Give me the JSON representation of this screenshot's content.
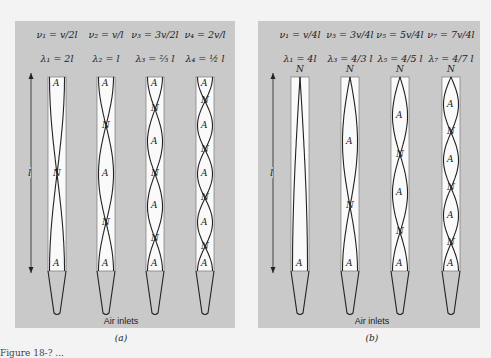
{
  "figure": {
    "panels": [
      {
        "id": "a",
        "sublabel": "(a)",
        "inlet_label": "Air inlets",
        "length_label": "l",
        "end_type": "open-open",
        "modes": [
          {
            "freq": "ν₁ = v/2l",
            "wavelength": "λ₁ = 2l",
            "harmonic": 1,
            "top": "A",
            "bottom": "A",
            "labels": [
              "A",
              "N",
              "A"
            ]
          },
          {
            "freq": "ν₂ = v/l",
            "wavelength": "λ₂ = l",
            "harmonic": 2,
            "top": "A",
            "bottom": "A",
            "labels": [
              "A",
              "N",
              "A",
              "N",
              "A"
            ]
          },
          {
            "freq": "ν₃ = 3v/2l",
            "wavelength": "λ₃ = ⅔ l",
            "harmonic": 3,
            "top": "A",
            "bottom": "A",
            "labels": [
              "A",
              "N",
              "A",
              "N",
              "A",
              "N",
              "A"
            ]
          },
          {
            "freq": "ν₄ = 2v/l",
            "wavelength": "λ₄ = ½ l",
            "harmonic": 4,
            "top": "A",
            "bottom": "A",
            "labels": [
              "A",
              "N",
              "A",
              "N",
              "A",
              "N",
              "A",
              "N",
              "A"
            ]
          }
        ]
      },
      {
        "id": "b",
        "sublabel": "(b)",
        "inlet_label": "Air inlets",
        "length_label": "l",
        "end_type": "closed-open",
        "modes": [
          {
            "freq": "ν₁ = v/4l",
            "wavelength": "λ₁ = 4l",
            "harmonic": 1,
            "top": "N",
            "bottom": "A",
            "labels": [
              "N",
              "A"
            ]
          },
          {
            "freq": "ν₃ = 3v/4l",
            "wavelength": "λ₃ = 4/3 l",
            "harmonic": 3,
            "top": "N",
            "bottom": "A",
            "labels": [
              "N",
              "A",
              "N",
              "A"
            ]
          },
          {
            "freq": "ν₅ = 5v/4l",
            "wavelength": "λ₅ = 4/5 l",
            "harmonic": 5,
            "top": "N",
            "bottom": "A",
            "labels": [
              "N",
              "A",
              "N",
              "A",
              "N",
              "A"
            ]
          },
          {
            "freq": "ν₇ = 7v/4l",
            "wavelength": "λ₇ = 4/7 l",
            "harmonic": 7,
            "top": "N",
            "bottom": "A",
            "labels": [
              "N",
              "A",
              "N",
              "A",
              "N",
              "A",
              "N",
              "A"
            ]
          }
        ]
      }
    ],
    "caption_partial": "Figure 18-? ..."
  },
  "colors": {
    "panel_bg": "#c9c9c9",
    "page_bg": "#f3f3f3",
    "tube_fill": "#fafafa",
    "line": "#222222"
  }
}
